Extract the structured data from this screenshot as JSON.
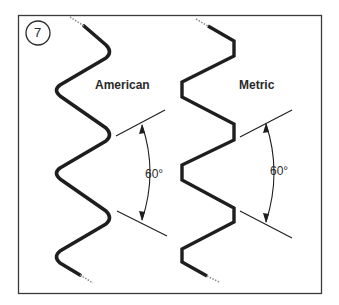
{
  "figure": {
    "number": "7",
    "colors": {
      "line": "#1e1e1e",
      "frame": "#3a3a3a",
      "background": "#ffffff"
    }
  },
  "threads": [
    {
      "label": "American",
      "profile": "rounded crests and roots",
      "angle_label": "60°"
    },
    {
      "label": "Metric",
      "profile": "flat crests and roots",
      "angle_label": "60°"
    }
  ]
}
